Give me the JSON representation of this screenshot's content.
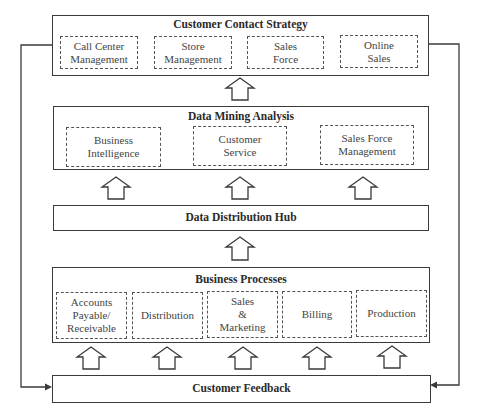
{
  "layers": {
    "contact_strategy": {
      "title": "Customer Contact Strategy",
      "items": [
        "Call Center\nManagement",
        "Store\nManagement",
        "Sales\nForce",
        "Online\nSales"
      ]
    },
    "data_mining": {
      "title": "Data Mining Analysis",
      "items": [
        "Business\nIntelligence",
        "Customer\nService",
        "Sales Force\nManagement"
      ]
    },
    "hub": {
      "title": "Data Distribution Hub"
    },
    "business_processes": {
      "title": "Business Processes",
      "items": [
        "Accounts\nPayable/\nReceivable",
        "Distribution",
        "Sales\n&\nMarketing",
        "Billing",
        "Production"
      ]
    },
    "feedback": {
      "title": "Customer Feedback"
    }
  },
  "colors": {
    "line": "#3a3a3a",
    "dashed": "#555555",
    "background": "#ffffff"
  }
}
